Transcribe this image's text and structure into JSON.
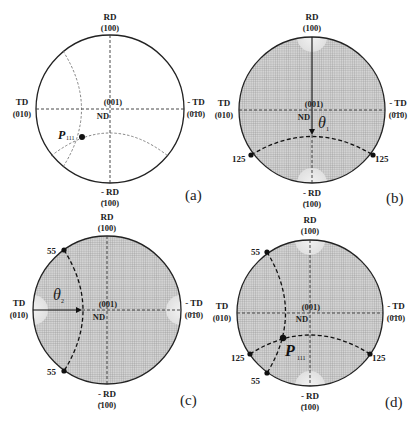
{
  "panels": [
    {
      "id": "a",
      "tag": "(a)",
      "labels": {
        "top": "RD",
        "top_idx": "(100)",
        "bottom": "- RD",
        "bottom_idx": "(̄100)",
        "left": "TD",
        "left_idx": "(010)",
        "right": "- TD",
        "right_idx": "(0̄1̄0)",
        "center": "(001)",
        "center_sub": "ND"
      },
      "point": {
        "name": "P",
        "subscript": "111"
      },
      "grid": false
    },
    {
      "id": "b",
      "tag": "(b)",
      "labels": {
        "top": "RD",
        "top_idx": "(100)",
        "bottom": "- RD",
        "bottom_idx": "(̄100)",
        "left": "TD",
        "left_idx": "(010)",
        "right": "- TD",
        "right_idx": "(0̄1̄0)",
        "center": "(001)",
        "center_sub": "ND"
      },
      "angle": {
        "symbol": "θ",
        "subscript": "1"
      },
      "markers": [
        "125",
        "125"
      ],
      "grid": true
    },
    {
      "id": "c",
      "tag": "(c)",
      "labels": {
        "top": "RD",
        "top_idx": "(100)",
        "bottom": "- RD",
        "bottom_idx": "(̄100)",
        "left": "TD",
        "left_idx": "(010)",
        "right": "- TD",
        "right_idx": "(0̄1̄0)",
        "center": "(001)",
        "center_sub": "ND"
      },
      "angle": {
        "symbol": "θ",
        "subscript": "2"
      },
      "markers": [
        "55",
        "55"
      ],
      "grid": true
    },
    {
      "id": "d",
      "tag": "(d)",
      "labels": {
        "top": "RD",
        "top_idx": "(100)",
        "bottom": "- RD",
        "bottom_idx": "(̄100)",
        "left": "TD",
        "left_idx": "(010)",
        "right": "- TD",
        "right_idx": "(0̄1̄0)",
        "center": "(001)",
        "center_sub": "ND"
      },
      "point": {
        "name": "P",
        "subscript": "111"
      },
      "markers": [
        "55",
        "55",
        "125",
        "125"
      ],
      "grid": true
    }
  ]
}
